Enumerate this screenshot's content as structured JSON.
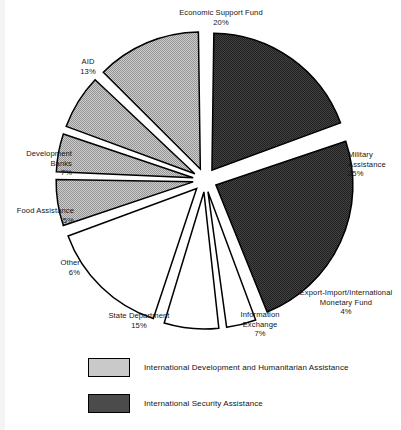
{
  "chart_data": {
    "type": "pie",
    "title": "",
    "subtitle": "",
    "xlabel": "",
    "ylabel": "",
    "grid": false,
    "legend_position": "bottom",
    "start_angle_deg": 0,
    "direction": "clockwise",
    "exploded": true,
    "categories": [
      "Economic Support Fund",
      "Military Assistance",
      "Export-Import/International Monetary Fund",
      "Information Exchange",
      "State Department",
      "Other",
      "Food Assistance",
      "Development Banks",
      "AID"
    ],
    "values": [
      20,
      25,
      4,
      7,
      15,
      6,
      5,
      7,
      13
    ],
    "value_labels": [
      "20%",
      "25%",
      "4%",
      "7%",
      "15%",
      "6%",
      "5%",
      "7%",
      "13%"
    ],
    "slices": [
      {
        "name": "Economic Support Fund",
        "label_line1": "Economic Support Fund",
        "label_line2": "",
        "pct": 20,
        "pct_label": "20%",
        "group": "International Security Assistance",
        "fill": "#3a3a3a"
      },
      {
        "name": "Military Assistance",
        "label_line1": "Military",
        "label_line2": "Assistance",
        "pct": 25,
        "pct_label": "25%",
        "group": "International Security Assistance",
        "fill": "#3a3a3a"
      },
      {
        "name": "Export-Import/International Monetary Fund",
        "label_line1": "Export-Import/International",
        "label_line2": "Monetary Fund",
        "pct": 4,
        "pct_label": "4%",
        "group": "unshaded",
        "fill": "#ffffff"
      },
      {
        "name": "Information Exchange",
        "label_line1": "Information",
        "label_line2": "Exchange",
        "pct": 7,
        "pct_label": "7%",
        "group": "unshaded",
        "fill": "#ffffff"
      },
      {
        "name": "State Department",
        "label_line1": "State Department",
        "label_line2": "",
        "pct": 15,
        "pct_label": "15%",
        "group": "unshaded",
        "fill": "#ffffff"
      },
      {
        "name": "Other",
        "label_line1": "Other",
        "label_line2": "",
        "pct": 6,
        "pct_label": "6%",
        "group": "International Development and Humanitarian Assistance",
        "fill": "#c9c9c9"
      },
      {
        "name": "Food Assistance",
        "label_line1": "Food Assistance",
        "label_line2": "",
        "pct": 5,
        "pct_label": "5%",
        "group": "International Development and Humanitarian Assistance",
        "fill": "#c9c9c9"
      },
      {
        "name": "Development Banks",
        "label_line1": "Development",
        "label_line2": "Banks",
        "pct": 7,
        "pct_label": "7%",
        "group": "International Development and Humanitarian Assistance",
        "fill": "#c9c9c9"
      },
      {
        "name": "AID",
        "label_line1": "AID",
        "label_line2": "",
        "pct": 13,
        "pct_label": "13%",
        "group": "International Development and Humanitarian Assistance",
        "fill": "#c9c9c9"
      }
    ],
    "legend": [
      {
        "label": "International Development and Humanitarian Assistance",
        "swatch": "#c9c9c9"
      },
      {
        "label": "International Security Assistance",
        "swatch": "#4b4b4b"
      }
    ],
    "colors": {
      "security": "#3a3a3a",
      "development": "#c9c9c9",
      "unshaded": "#ffffff",
      "outline": "#000000",
      "background": "#ffffff",
      "text": "#141414"
    }
  }
}
